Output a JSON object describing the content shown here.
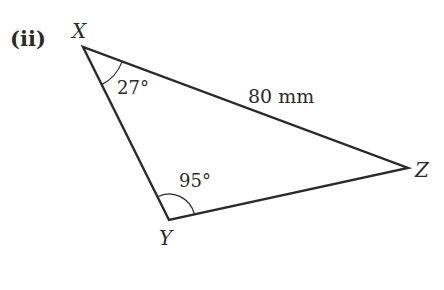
{
  "part_label": "(ii)",
  "triangle": {
    "vertices": {
      "X": {
        "label": "X"
      },
      "Y": {
        "label": "Y"
      },
      "Z": {
        "label": "Z"
      }
    },
    "angles": {
      "X": "27°",
      "Y": "95°"
    },
    "sides": {
      "XZ": "80 mm"
    }
  },
  "colors": {
    "line": "#2a2a2a",
    "background": "#ffffff"
  }
}
